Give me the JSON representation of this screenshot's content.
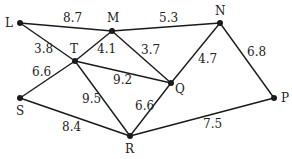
{
  "graph": {
    "nodes": [
      {
        "id": "L",
        "x": 20,
        "y": 23,
        "lx": 5,
        "ly": 27
      },
      {
        "id": "M",
        "x": 112,
        "y": 31,
        "lx": 107,
        "ly": 22
      },
      {
        "id": "N",
        "x": 220,
        "y": 23,
        "lx": 215,
        "ly": 15
      },
      {
        "id": "T",
        "x": 75,
        "y": 61,
        "lx": 70,
        "ly": 53
      },
      {
        "id": "Q",
        "x": 171,
        "y": 83,
        "lx": 175,
        "ly": 93
      },
      {
        "id": "S",
        "x": 20,
        "y": 98,
        "lx": 16,
        "ly": 115
      },
      {
        "id": "R",
        "x": 130,
        "y": 136,
        "lx": 125,
        "ly": 153
      },
      {
        "id": "P",
        "x": 274,
        "y": 98,
        "lx": 281,
        "ly": 102
      }
    ],
    "edges": [
      {
        "from": "L",
        "to": "M",
        "weight": "8.7",
        "lx": 63,
        "ly": 22
      },
      {
        "from": "M",
        "to": "N",
        "weight": "5.3",
        "lx": 159,
        "ly": 22
      },
      {
        "from": "L",
        "to": "T",
        "weight": "3.8",
        "lx": 34,
        "ly": 53
      },
      {
        "from": "T",
        "to": "M",
        "weight": "4.1",
        "lx": 97,
        "ly": 53
      },
      {
        "from": "M",
        "to": "Q",
        "weight": "3.7",
        "lx": 141,
        "ly": 54
      },
      {
        "from": "T",
        "to": "Q",
        "weight": "9.2",
        "lx": 113,
        "ly": 84
      },
      {
        "from": "N",
        "to": "Q",
        "weight": "4.7",
        "lx": 198,
        "ly": 63
      },
      {
        "from": "N",
        "to": "P",
        "weight": "6.8",
        "lx": 247,
        "ly": 56
      },
      {
        "from": "T",
        "to": "S",
        "weight": "6.6",
        "lx": 32,
        "ly": 76
      },
      {
        "from": "T",
        "to": "R",
        "weight": "9.5",
        "lx": 82,
        "ly": 103
      },
      {
        "from": "Q",
        "to": "R",
        "weight": "6.6",
        "lx": 135,
        "ly": 110
      },
      {
        "from": "S",
        "to": "R",
        "weight": "8.4",
        "lx": 62,
        "ly": 131
      },
      {
        "from": "R",
        "to": "P",
        "weight": "7.5",
        "lx": 203,
        "ly": 128
      }
    ]
  }
}
